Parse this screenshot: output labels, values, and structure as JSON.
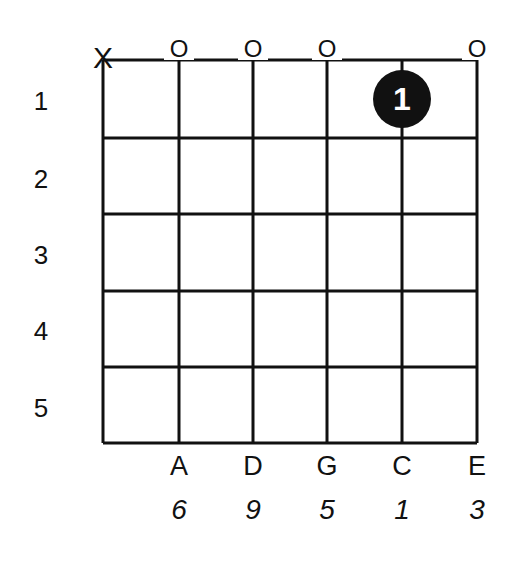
{
  "chord": {
    "strings": [
      "X",
      "A",
      "D",
      "G",
      "C",
      "E"
    ],
    "open_markers": [
      "X",
      "O",
      "O",
      "O",
      "",
      "O"
    ],
    "notes": [
      "",
      "A",
      "D",
      "G",
      "C",
      "E"
    ],
    "intervals": [
      "",
      "6",
      "9",
      "5",
      "1",
      "3"
    ],
    "fret_numbers": [
      "1",
      "2",
      "3",
      "4",
      "5"
    ],
    "fingers": [
      {
        "string": 5,
        "fret": 1,
        "label": "1"
      }
    ]
  },
  "colors": {
    "line": "#111111",
    "dot": "#111111",
    "background": "#ffffff"
  }
}
